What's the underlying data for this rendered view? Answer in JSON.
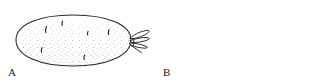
{
  "figure": {
    "kind": "line-drawing",
    "style": "pen-and-ink stipple",
    "background_color": "#fdfdfc",
    "ink_color": "#2b2b28",
    "stipple_color": "#4a4a44",
    "width": 318,
    "height": 82
  },
  "panels": [
    {
      "id": "a",
      "label": "A",
      "caption_label": "A",
      "description": "whole potato tuber with eyes and a sprout cluster at the right end",
      "eye_count": 6,
      "sprout_clusters": 1,
      "cut_lines": 0
    },
    {
      "id": "b",
      "label": "B",
      "caption_label": "B",
      "description": "potato tuber divided by cut lines into seed pieces, each piece bearing a sprouting eye",
      "eye_count": 2,
      "sprout_clusters": 4,
      "cut_lines": 4,
      "pieces": 4
    }
  ]
}
